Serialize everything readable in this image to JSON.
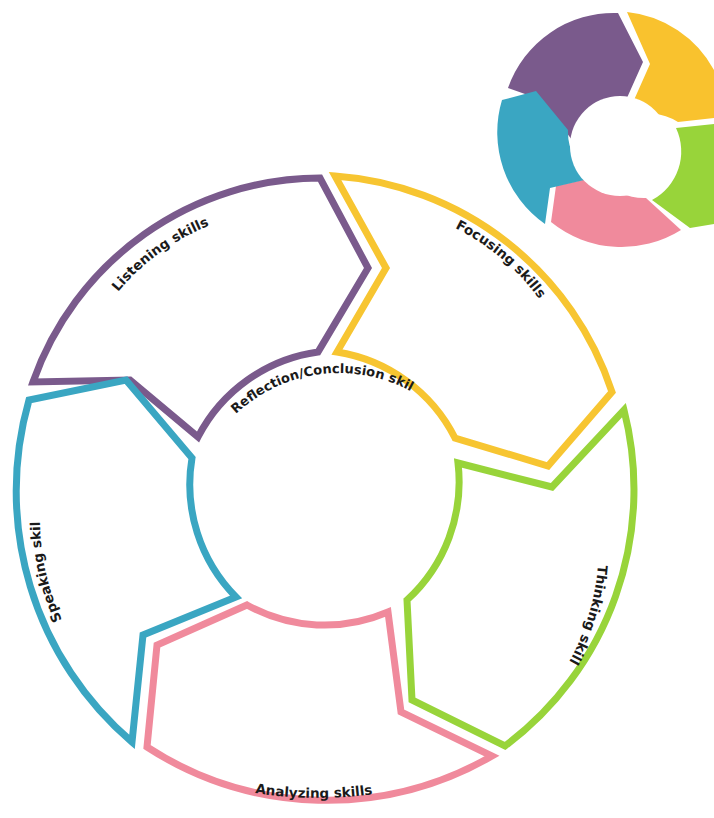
{
  "diagram": {
    "type": "cycle",
    "center_label": "Reflection/Conclusion skills",
    "segments": [
      {
        "label": "Listening skills",
        "color": "#7a5a8c"
      },
      {
        "label": "Focusing skills",
        "color": "#f7c531"
      },
      {
        "label": "Thinking skills",
        "color": "#98d43a"
      },
      {
        "label": "Analyzing skills",
        "color": "#f08a9c"
      },
      {
        "label": "Speaking skills",
        "color": "#3aa6c2"
      }
    ],
    "mini_icon": {
      "colors": [
        "#7a5a8c",
        "#f9c22e",
        "#98d43a",
        "#f08a9c",
        "#3aa6c2"
      ]
    }
  }
}
